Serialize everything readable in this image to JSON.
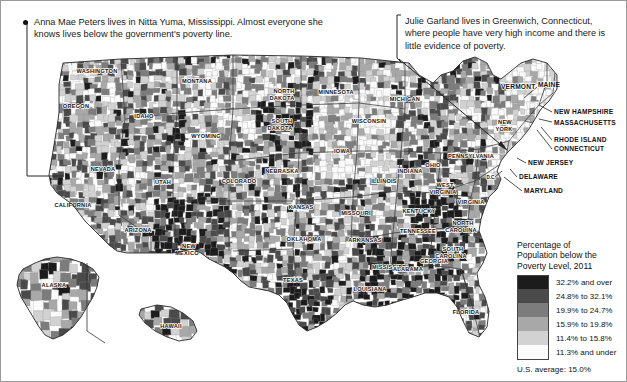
{
  "annotations": [
    {
      "id": "anna-mae-peters",
      "text": "Anna Mae Peters lives in Nitta Yuma, Mississippi. Almost everyone she knows lives below the government's poverty line."
    },
    {
      "id": "julie-garland",
      "text": "Julie Garland lives in Greenwich, Connecticut, where people have very high income and there is little evidence of poverty."
    }
  ],
  "legend": {
    "title_lines": [
      "Percentage of",
      "Population below the",
      "Poverty Level, 2011"
    ],
    "classes": [
      {
        "label": "32.2% and over",
        "color": "#1c1c1c"
      },
      {
        "label": "24.8% to 32.1%",
        "color": "#4a4a4a"
      },
      {
        "label": "19.9% to 24.7%",
        "color": "#7c7c7c"
      },
      {
        "label": "15.9% to 19.8%",
        "color": "#a8a8a8"
      },
      {
        "label": "11.4% to 15.8%",
        "color": "#d2d2d2"
      },
      {
        "label": "11.3% and under",
        "color": "#fbfbfb"
      }
    ],
    "footnote": "U.S. average: 15.0%"
  },
  "map": {
    "interior_labels": [
      {
        "name": "WASHINGTON",
        "x": 96,
        "y": 72
      },
      {
        "name": "OREGON",
        "x": 75,
        "y": 107
      },
      {
        "name": "IDAHO",
        "x": 143,
        "y": 117
      },
      {
        "name": "MONTANA",
        "x": 196,
        "y": 82
      },
      {
        "name": "WYOMING",
        "x": 205,
        "y": 137
      },
      {
        "name": "NEVADA",
        "x": 102,
        "y": 170
      },
      {
        "name": "UTAH",
        "x": 162,
        "y": 183
      },
      {
        "name": "CALIFORNIA",
        "x": 72,
        "y": 206
      },
      {
        "name": "ARIZONA",
        "x": 137,
        "y": 231
      },
      {
        "name": "NEW",
        "x": 188,
        "y": 247
      },
      {
        "name": "MEXICO",
        "x": 186,
        "y": 254
      },
      {
        "name": "COLORADO",
        "x": 238,
        "y": 182
      },
      {
        "name": "NORTH",
        "x": 283,
        "y": 92
      },
      {
        "name": "DAKOTA",
        "x": 281,
        "y": 99
      },
      {
        "name": "SOUTH",
        "x": 281,
        "y": 122
      },
      {
        "name": "DAKOTA",
        "x": 279,
        "y": 129
      },
      {
        "name": "NEBRASKA",
        "x": 281,
        "y": 172
      },
      {
        "name": "KANSAS",
        "x": 300,
        "y": 208
      },
      {
        "name": "OKLAHOMA",
        "x": 303,
        "y": 240
      },
      {
        "name": "TEXAS",
        "x": 292,
        "y": 281
      },
      {
        "name": "MINNESOTA",
        "x": 335,
        "y": 93
      },
      {
        "name": "IOWA",
        "x": 341,
        "y": 152
      },
      {
        "name": "MISSOURI",
        "x": 355,
        "y": 214
      },
      {
        "name": "ARKANSAS",
        "x": 364,
        "y": 241
      },
      {
        "name": "LOUISIANA",
        "x": 369,
        "y": 290
      },
      {
        "name": "WISCONSIN",
        "x": 368,
        "y": 122
      },
      {
        "name": "ILLINOIS",
        "x": 383,
        "y": 182
      },
      {
        "name": "MICHIGAN",
        "x": 404,
        "y": 100
      },
      {
        "name": "INDIANA",
        "x": 409,
        "y": 172
      },
      {
        "name": "OHIO",
        "x": 432,
        "y": 166
      },
      {
        "name": "KENTUCKY",
        "x": 418,
        "y": 212
      },
      {
        "name": "TENNESSEE",
        "x": 417,
        "y": 232
      },
      {
        "name": "MISSISSIPPI",
        "x": 389,
        "y": 268
      },
      {
        "name": "ALABAMA",
        "x": 407,
        "y": 270
      },
      {
        "name": "GEORGIA",
        "x": 433,
        "y": 262
      },
      {
        "name": "FLORIDA",
        "x": 465,
        "y": 313
      },
      {
        "name": "SOUTH",
        "x": 452,
        "y": 250
      },
      {
        "name": "CAROLINA",
        "x": 450,
        "y": 257
      },
      {
        "name": "NORTH",
        "x": 462,
        "y": 224
      },
      {
        "name": "CAROLINA",
        "x": 460,
        "y": 231
      },
      {
        "name": "VIRGINIA",
        "x": 470,
        "y": 203
      },
      {
        "name": "WEST",
        "x": 444,
        "y": 186
      },
      {
        "name": "VIRGINIA",
        "x": 442,
        "y": 193
      },
      {
        "name": "PENNSYLVANIA",
        "x": 470,
        "y": 157
      },
      {
        "name": "NEW",
        "x": 504,
        "y": 123
      },
      {
        "name": "YORK",
        "x": 503,
        "y": 130
      },
      {
        "name": "ALASKA",
        "x": 53,
        "y": 286
      },
      {
        "name": "HAWAII",
        "x": 170,
        "y": 327
      }
    ],
    "northeast_labels": [
      {
        "name": "VERMONT",
        "x": 500,
        "y": 88,
        "lx1": 536,
        "ly1": 86,
        "lx2": 523,
        "ly2": 97
      },
      {
        "name": "MAINE",
        "x": 548,
        "y": 86,
        "lx1": 0,
        "ly1": 0,
        "lx2": 0,
        "ly2": 0
      },
      {
        "name": "NEW HAMPSHIRE",
        "x": 553,
        "y": 113,
        "lx1": 551,
        "ly1": 111,
        "lx2": 538,
        "ly2": 104
      },
      {
        "name": "MASSACHUSETTS",
        "x": 553,
        "y": 124,
        "lx1": 551,
        "ly1": 121,
        "lx2": 538,
        "ly2": 118
      },
      {
        "name": "RHODE ISLAND",
        "x": 553,
        "y": 141,
        "lx1": 551,
        "ly1": 139,
        "lx2": 540,
        "ly2": 126
      },
      {
        "name": "CONNECTICUT",
        "x": 553,
        "y": 150,
        "lx1": 551,
        "ly1": 148,
        "lx2": 536,
        "ly2": 129
      },
      {
        "name": "NEW JERSEY",
        "x": 527,
        "y": 164,
        "lx1": 525,
        "ly1": 162,
        "lx2": 516,
        "ly2": 157
      },
      {
        "name": "DELAWARE",
        "x": 518,
        "y": 178,
        "lx1": 516,
        "ly1": 176,
        "lx2": 509,
        "ly2": 168
      },
      {
        "name": "MARYLAND",
        "x": 523,
        "y": 192,
        "lx1": 521,
        "ly1": 190,
        "lx2": 503,
        "ly2": 176
      }
    ],
    "dc_label": {
      "name": "D.C.",
      "x": 490,
      "y": 178
    }
  }
}
